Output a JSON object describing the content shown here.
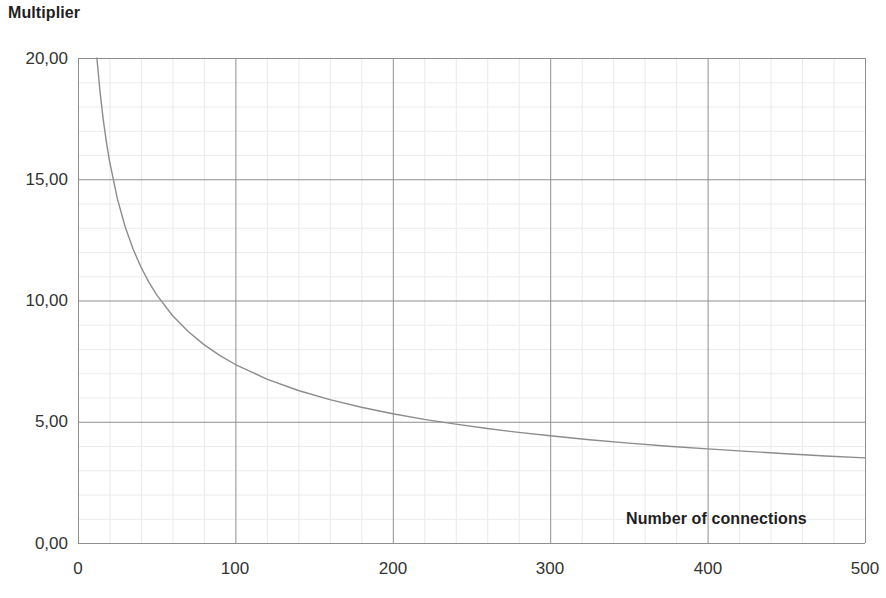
{
  "chart_data": {
    "type": "line",
    "title": "Multiplier",
    "subtitle": "",
    "xlabel": "Number of connections",
    "ylabel": "Multiplier",
    "xlim": [
      0,
      500
    ],
    "ylim": [
      0,
      20
    ],
    "grid": true,
    "minor_grid": true,
    "legend": false,
    "legend_position": "none",
    "x_ticks": [
      0,
      100,
      200,
      300,
      400,
      500
    ],
    "x_tick_labels": [
      "0",
      "100",
      "200",
      "300",
      "400",
      "500"
    ],
    "y_ticks": [
      0,
      5,
      10,
      15,
      20
    ],
    "y_tick_labels": [
      "0,00",
      "5,00",
      "10,00",
      "15,00",
      "20,00"
    ],
    "x_minor_step": 20,
    "y_minor_step": 1,
    "decimal_separator": ",",
    "series": [
      {
        "name": "Multiplier",
        "color": "#8c8c8c",
        "line_width": 1.4,
        "x": [
          12,
          14,
          16,
          18,
          20,
          25,
          30,
          35,
          40,
          45,
          50,
          60,
          70,
          80,
          90,
          100,
          120,
          140,
          160,
          180,
          200,
          220,
          240,
          260,
          280,
          300,
          325,
          350,
          375,
          400,
          425,
          450,
          475,
          500
        ],
        "values": [
          20.0,
          18.6,
          17.48,
          16.55,
          15.76,
          14.2,
          13.03,
          12.12,
          11.38,
          10.76,
          10.23,
          9.38,
          8.72,
          8.18,
          7.74,
          7.36,
          6.76,
          6.29,
          5.91,
          5.6,
          5.33,
          5.1,
          4.9,
          4.72,
          4.56,
          4.42,
          4.26,
          4.12,
          3.99,
          3.88,
          3.78,
          3.68,
          3.59,
          3.51
        ]
      }
    ],
    "annotations": []
  },
  "chart": {
    "title": "Multiplier",
    "x_axis_title": "Number of connections",
    "colors": {
      "curve": "#8c8c8c",
      "major_grid": "#8f8f8f",
      "minor_grid": "#e8e8e8",
      "text": "#333333",
      "background": "#ffffff"
    }
  }
}
